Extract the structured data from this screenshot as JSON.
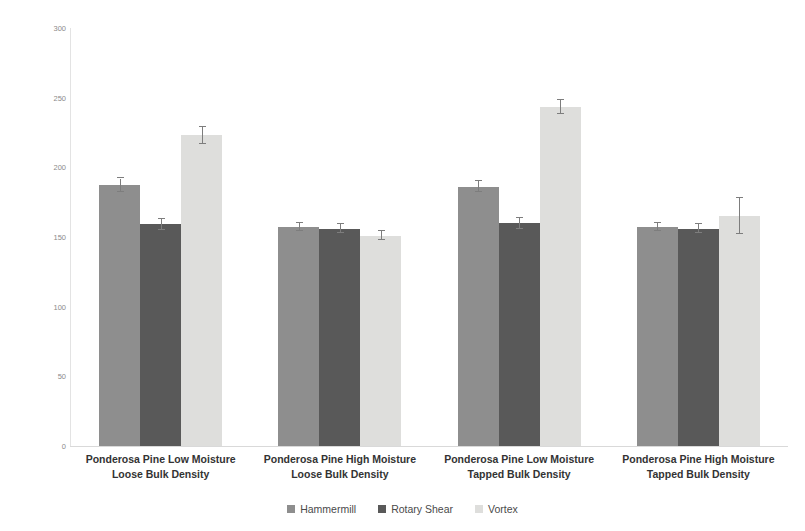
{
  "chart_data": {
    "type": "bar",
    "title": "",
    "xlabel": "",
    "ylabel": "Density (kg/m^3)",
    "ylim": [
      0,
      300
    ],
    "ytick_labels": [
      "300",
      "250",
      "200",
      "150",
      "100",
      "50",
      "0"
    ],
    "ytick_values": [
      300,
      250,
      200,
      150,
      100,
      50,
      0
    ],
    "grid": false,
    "legend_position": "bottom",
    "categories": [
      "Ponderosa Pine Low Moisture Loose Bulk Density",
      "Ponderosa Pine High Moisture Loose Bulk Density",
      "Ponderosa Pine Low Moisture Tapped Bulk Density",
      "Ponderosa Pine High Moisture Tapped Bulk Density"
    ],
    "category_lines": [
      [
        "Ponderosa Pine Low Moisture",
        "Loose Bulk Density"
      ],
      [
        "Ponderosa Pine High Moisture",
        "Loose Bulk Density"
      ],
      [
        "Ponderosa Pine Low Moisture",
        "Tapped Bulk Density"
      ],
      [
        "Ponderosa Pine High Moisture",
        "Tapped Bulk Density"
      ]
    ],
    "series": [
      {
        "name": "Hammermill",
        "color": "#8e8e8e",
        "values": [
          187,
          157,
          186,
          157
        ],
        "errors": [
          5,
          3,
          4,
          3
        ]
      },
      {
        "name": "Rotary Shear",
        "color": "#595959",
        "values": [
          159,
          156,
          160,
          156
        ],
        "errors": [
          4,
          3,
          4,
          3
        ]
      },
      {
        "name": "Vortex",
        "color": "#dededc",
        "values": [
          223,
          151,
          243,
          165
        ],
        "errors": [
          6,
          3,
          5,
          13
        ]
      }
    ]
  },
  "legend": {
    "items": [
      {
        "label": "Hammermill",
        "color": "#8e8e8e"
      },
      {
        "label": "Rotary Shear",
        "color": "#595959"
      },
      {
        "label": "Vortex",
        "color": "#dededc"
      }
    ]
  },
  "axes": {
    "y_title": "Density (kg/m^3)"
  },
  "colors": {
    "hammermill": "#8e8e8e",
    "rotary_shear": "#595959",
    "vortex": "#dededc",
    "error_bar": "#7d7d7d",
    "axis": "#d9d9d9",
    "tick_text": "#8a8a8a",
    "label_text": "#333333"
  }
}
